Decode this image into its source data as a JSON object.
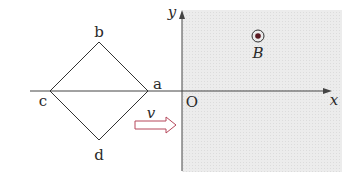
{
  "diagram": {
    "field_region": {
      "fill": "#e9e9e9",
      "description": "magnetic field region (x > 0)"
    },
    "axes": {
      "x_label": "x",
      "y_label": "y",
      "origin_label": "O",
      "color": "#444444"
    },
    "square_loop": {
      "vertices": [
        {
          "name": "a",
          "label": "a"
        },
        {
          "name": "b",
          "label": "b"
        },
        {
          "name": "c",
          "label": "c"
        },
        {
          "name": "d",
          "label": "d"
        }
      ],
      "color": "#333333"
    },
    "velocity": {
      "label": "v",
      "arrow_color": "#b5475a"
    },
    "field_symbol": {
      "label": "B",
      "symbol": "dot-in-circle (out of page)",
      "color": "#5a1a22"
    }
  }
}
